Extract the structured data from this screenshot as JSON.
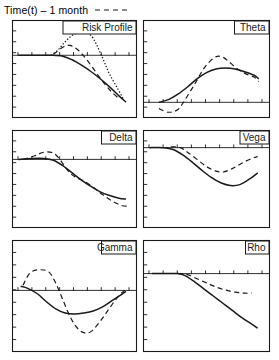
{
  "figure": {
    "width": 279,
    "height": 360,
    "background": "#ffffff",
    "ink": "#1a1a1a",
    "legend": {
      "label": "Time(t) – 1 month",
      "sample_style": "dashed",
      "sample_name": "dashed-line-sample"
    }
  },
  "chart_data": {
    "type": "line",
    "title": "Time(t) – 1 month",
    "layout": {
      "rows": 3,
      "cols": 2,
      "grid": false,
      "legend_position": "top-left"
    },
    "shared": {
      "xlabel": "",
      "ylabel": "",
      "x_axis": "underlying price (ticks only, unlabeled)",
      "xlim": [
        0,
        1
      ],
      "tick_count": 9,
      "series_names": [
        "current",
        "at expiry/1 month",
        "alternate"
      ]
    },
    "panels": [
      {
        "title": "Risk Profile",
        "zero_line_frac": 0.36,
        "ylabel": "",
        "series": [
          {
            "name": "solid",
            "style": "solid",
            "points": [
              [
                0.02,
                0.0
              ],
              [
                0.18,
                0.0
              ],
              [
                0.3,
                0.0
              ],
              [
                0.4,
                -0.02
              ],
              [
                0.48,
                -0.1
              ],
              [
                0.56,
                -0.22
              ],
              [
                0.64,
                -0.36
              ],
              [
                0.72,
                -0.52
              ],
              [
                0.8,
                -0.7
              ],
              [
                0.88,
                -0.9
              ],
              [
                0.94,
                -1.04
              ]
            ]
          },
          {
            "name": "dotted",
            "style": "dotted",
            "points": [
              [
                0.3,
                0.0
              ],
              [
                0.36,
                0.12
              ],
              [
                0.42,
                0.3
              ],
              [
                0.48,
                0.44
              ],
              [
                0.54,
                0.5
              ],
              [
                0.6,
                0.5
              ],
              [
                0.64,
                0.44
              ],
              [
                0.68,
                0.28
              ],
              [
                0.72,
                0.06
              ],
              [
                0.76,
                -0.18
              ],
              [
                0.8,
                -0.42
              ],
              [
                0.86,
                -0.7
              ],
              [
                0.92,
                -0.98
              ]
            ]
          },
          {
            "name": "dashed",
            "style": "dashed",
            "points": [
              [
                0.32,
                0.02
              ],
              [
                0.4,
                0.18
              ],
              [
                0.46,
                0.22
              ],
              [
                0.52,
                0.14
              ],
              [
                0.58,
                -0.02
              ],
              [
                0.64,
                -0.22
              ],
              [
                0.7,
                -0.44
              ],
              [
                0.76,
                -0.64
              ],
              [
                0.82,
                -0.82
              ],
              [
                0.88,
                -0.96
              ]
            ]
          }
        ]
      },
      {
        "title": "Theta",
        "zero_line_frac": 0.84,
        "ylabel": "",
        "series": [
          {
            "name": "solid",
            "style": "solid",
            "points": [
              [
                0.1,
                0.0
              ],
              [
                0.18,
                0.06
              ],
              [
                0.26,
                0.18
              ],
              [
                0.34,
                0.34
              ],
              [
                0.42,
                0.52
              ],
              [
                0.5,
                0.66
              ],
              [
                0.58,
                0.74
              ],
              [
                0.66,
                0.76
              ],
              [
                0.74,
                0.74
              ],
              [
                0.82,
                0.68
              ],
              [
                0.9,
                0.6
              ],
              [
                0.94,
                0.52
              ]
            ]
          },
          {
            "name": "dashed",
            "style": "dashed",
            "points": [
              [
                0.1,
                -0.14
              ],
              [
                0.18,
                -0.22
              ],
              [
                0.26,
                -0.16
              ],
              [
                0.32,
                0.06
              ],
              [
                0.4,
                0.4
              ],
              [
                0.48,
                0.76
              ],
              [
                0.56,
                0.98
              ],
              [
                0.62,
                1.02
              ],
              [
                0.68,
                0.92
              ],
              [
                0.76,
                0.74
              ],
              [
                0.84,
                0.62
              ],
              [
                0.9,
                0.56
              ],
              [
                0.94,
                0.46
              ]
            ]
          }
        ]
      },
      {
        "title": "Delta",
        "zero_line_frac": 0.3,
        "ylabel": "",
        "series": [
          {
            "name": "solid",
            "style": "solid",
            "points": [
              [
                0.02,
                0.0
              ],
              [
                0.14,
                0.02
              ],
              [
                0.24,
                0.02
              ],
              [
                0.32,
                -0.02
              ],
              [
                0.4,
                -0.14
              ],
              [
                0.48,
                -0.3
              ],
              [
                0.56,
                -0.46
              ],
              [
                0.64,
                -0.6
              ],
              [
                0.72,
                -0.72
              ],
              [
                0.8,
                -0.8
              ],
              [
                0.88,
                -0.86
              ],
              [
                0.94,
                -0.88
              ]
            ]
          },
          {
            "name": "dashed",
            "style": "dashed",
            "points": [
              [
                0.06,
                0.0
              ],
              [
                0.16,
                0.08
              ],
              [
                0.24,
                0.16
              ],
              [
                0.32,
                0.14
              ],
              [
                0.38,
                -0.02
              ],
              [
                0.44,
                -0.24
              ],
              [
                0.5,
                -0.38
              ],
              [
                0.58,
                -0.48
              ],
              [
                0.66,
                -0.62
              ],
              [
                0.74,
                -0.78
              ],
              [
                0.82,
                -0.92
              ],
              [
                0.9,
                -1.02
              ],
              [
                0.95,
                -1.04
              ]
            ]
          }
        ]
      },
      {
        "title": "Vega",
        "zero_line_frac": 0.18,
        "ylabel": "",
        "series": [
          {
            "name": "solid",
            "style": "solid",
            "points": [
              [
                0.02,
                0.0
              ],
              [
                0.14,
                0.0
              ],
              [
                0.22,
                -0.04
              ],
              [
                0.3,
                -0.16
              ],
              [
                0.38,
                -0.32
              ],
              [
                0.46,
                -0.5
              ],
              [
                0.54,
                -0.66
              ],
              [
                0.62,
                -0.78
              ],
              [
                0.7,
                -0.84
              ],
              [
                0.78,
                -0.82
              ],
              [
                0.86,
                -0.7
              ],
              [
                0.93,
                -0.56
              ]
            ]
          },
          {
            "name": "dashed",
            "style": "dashed",
            "points": [
              [
                0.2,
                0.02
              ],
              [
                0.28,
                0.0
              ],
              [
                0.34,
                -0.1
              ],
              [
                0.42,
                -0.26
              ],
              [
                0.5,
                -0.42
              ],
              [
                0.58,
                -0.52
              ],
              [
                0.64,
                -0.54
              ],
              [
                0.72,
                -0.46
              ],
              [
                0.8,
                -0.34
              ],
              [
                0.88,
                -0.24
              ],
              [
                0.93,
                -0.2
              ]
            ]
          }
        ]
      },
      {
        "title": "Gamma",
        "zero_line_frac": 0.45,
        "ylabel": "",
        "series": [
          {
            "name": "solid",
            "style": "solid",
            "points": [
              [
                0.04,
                0.08
              ],
              [
                0.1,
                0.04
              ],
              [
                0.18,
                -0.06
              ],
              [
                0.26,
                -0.22
              ],
              [
                0.34,
                -0.36
              ],
              [
                0.42,
                -0.44
              ],
              [
                0.5,
                -0.46
              ],
              [
                0.58,
                -0.44
              ],
              [
                0.66,
                -0.4
              ],
              [
                0.74,
                -0.32
              ],
              [
                0.82,
                -0.2
              ],
              [
                0.9,
                -0.08
              ],
              [
                0.94,
                -0.02
              ]
            ]
          },
          {
            "name": "dashed",
            "style": "dashed",
            "points": [
              [
                0.06,
                0.1
              ],
              [
                0.12,
                0.34
              ],
              [
                0.2,
                0.4
              ],
              [
                0.28,
                0.36
              ],
              [
                0.34,
                0.14
              ],
              [
                0.4,
                -0.18
              ],
              [
                0.46,
                -0.5
              ],
              [
                0.52,
                -0.72
              ],
              [
                0.58,
                -0.82
              ],
              [
                0.64,
                -0.8
              ],
              [
                0.72,
                -0.6
              ],
              [
                0.8,
                -0.34
              ],
              [
                0.88,
                -0.1
              ],
              [
                0.93,
                0.0
              ]
            ]
          }
        ]
      },
      {
        "title": "Rho",
        "zero_line_frac": 0.3,
        "ylabel": "",
        "series": [
          {
            "name": "solid",
            "style": "solid",
            "points": [
              [
                0.04,
                0.0
              ],
              [
                0.16,
                0.0
              ],
              [
                0.26,
                0.0
              ],
              [
                0.32,
                -0.04
              ],
              [
                0.4,
                -0.16
              ],
              [
                0.48,
                -0.3
              ],
              [
                0.56,
                -0.44
              ],
              [
                0.64,
                -0.58
              ],
              [
                0.72,
                -0.72
              ],
              [
                0.8,
                -0.86
              ],
              [
                0.88,
                -0.98
              ],
              [
                0.93,
                -1.06
              ]
            ]
          },
          {
            "name": "dashed",
            "style": "dashed",
            "points": [
              [
                0.26,
                0.0
              ],
              [
                0.34,
                -0.02
              ],
              [
                0.42,
                -0.1
              ],
              [
                0.5,
                -0.18
              ],
              [
                0.58,
                -0.26
              ],
              [
                0.66,
                -0.32
              ],
              [
                0.74,
                -0.36
              ],
              [
                0.82,
                -0.38
              ],
              [
                0.88,
                -0.38
              ]
            ]
          }
        ]
      }
    ]
  }
}
